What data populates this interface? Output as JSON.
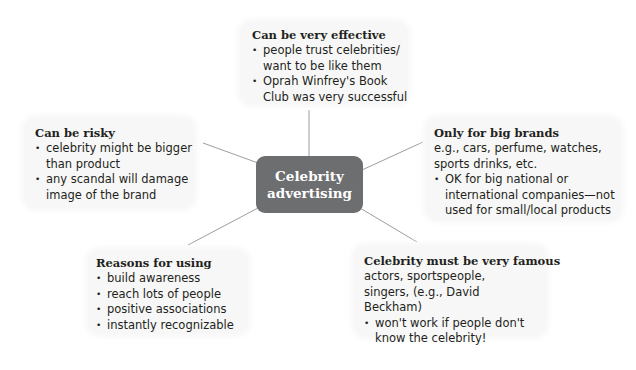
{
  "center": {
    "line1": "Celebrity",
    "line2": "advertising",
    "color": "#6d6e70"
  },
  "nodes": {
    "effective": {
      "title": "Can be very effective",
      "bullets": [
        "people trust celebrities/ want to be like them",
        "Oprah Winfrey's Book Club was very successful"
      ]
    },
    "risky": {
      "title": "Can be risky",
      "bullets": [
        "celebrity might be bigger than product",
        "any scandal will damage image of the brand"
      ]
    },
    "big_brands": {
      "title": "Only for big brands",
      "intro": "e.g., cars, perfume, watches, sports drinks, etc.",
      "bullets": [
        "OK for big national or international companies—not used for small/local products"
      ]
    },
    "reasons": {
      "title": "Reasons for using",
      "bullets": [
        "build awareness",
        "reach lots of people",
        "positive associations",
        "instantly recognizable"
      ]
    },
    "famous": {
      "title": "Celebrity must be very famous",
      "intro": "actors, sportspeople, singers, (e.g., David Beckham)",
      "bullets": [
        "won't work if people don't know the celebrity!"
      ]
    }
  }
}
